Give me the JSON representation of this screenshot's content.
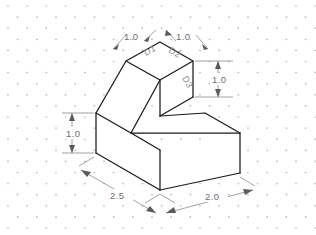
{
  "canvas": {
    "width": 316,
    "height": 235,
    "background": "#ffffff",
    "paper_type": "isometric-dot-grid",
    "dot_color": "#b9b9c4"
  },
  "drawing": {
    "title": "",
    "type": "isometric-pictorial",
    "object_description": "Stepped block with inclined (chamfered) top face on rectangular base",
    "line_color": "#1a1a1a",
    "dimension_color": "#6e6e6e",
    "label_color": "#8a8a8a"
  },
  "dimensions": [
    {
      "id": "dim-top-left",
      "value": "1.0",
      "placement": "top-left-leader",
      "orientation": "leader",
      "text_x": 130,
      "text_y": 36
    },
    {
      "id": "dim-top-right",
      "value": "1.0",
      "placement": "top-right-leader",
      "orientation": "leader",
      "text_x": 182,
      "text_y": 36
    },
    {
      "id": "dim-right-vertical",
      "value": "1.0",
      "placement": "right-side",
      "orientation": "vertical",
      "text_x": 221,
      "text_y": 84
    },
    {
      "id": "dim-left-vertical",
      "value": "1.0",
      "placement": "left-side",
      "orientation": "vertical",
      "text_x": 69,
      "text_y": 137
    },
    {
      "id": "dim-bottom-left",
      "value": "2.5",
      "placement": "bottom-left",
      "orientation": "isometric-left",
      "text_x": 120,
      "text_y": 199
    },
    {
      "id": "dim-bottom-right",
      "value": "2.0",
      "placement": "bottom-right",
      "orientation": "isometric-right",
      "text_x": 216,
      "text_y": 199
    }
  ],
  "face_labels": [
    {
      "id": "label-d1",
      "text": "D1",
      "face": "top-face-left",
      "rotation": -30,
      "x": 146,
      "y": 56
    },
    {
      "id": "label-d2",
      "text": "D2",
      "face": "top-face-right",
      "rotation": 30,
      "x": 170,
      "y": 52
    },
    {
      "id": "label-d3",
      "text": "D3",
      "face": "right-face-upper",
      "rotation": 60,
      "x": 184,
      "y": 80
    }
  ],
  "geometry": {
    "vertices": {
      "top_back": [
        160,
        42
      ],
      "top_left": [
        126,
        61
      ],
      "top_right": [
        193,
        61
      ],
      "top_front": [
        160,
        80
      ],
      "slope_bottom_left": [
        96,
        113
      ],
      "slope_bottom_front": [
        131,
        133
      ],
      "upper_right_lower": [
        193,
        97
      ],
      "base_top_left": [
        96,
        113
      ],
      "base_top_mid": [
        131,
        133
      ],
      "base_top_right": [
        240,
        133
      ],
      "base_front_left": [
        96,
        153
      ],
      "base_front_bottom": [
        160,
        190
      ],
      "base_right_bottom": [
        240,
        173
      ]
    }
  },
  "notes": {
    "units": "inches",
    "scale_note": ""
  }
}
